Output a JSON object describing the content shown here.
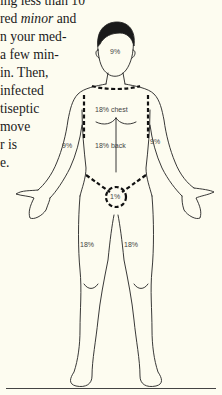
{
  "body_text": {
    "lines": [
      "ing less than 10",
      "red ",
      "n your med-",
      "a few min-",
      "in. Then,",
      "infected",
      "tiseptic",
      "move",
      "r  is",
      "e."
    ],
    "italic_word": "minor",
    "line1_suffix": " and"
  },
  "figure": {
    "labels": {
      "head": "9%",
      "chest": "18% chest",
      "back": "18% back",
      "right_arm": "9%",
      "left_arm": "9%",
      "groin": "1%",
      "right_leg": "18%",
      "left_leg": "18%"
    }
  },
  "colors": {
    "background": "#fdfcf0",
    "ink": "#1a1a1a"
  }
}
